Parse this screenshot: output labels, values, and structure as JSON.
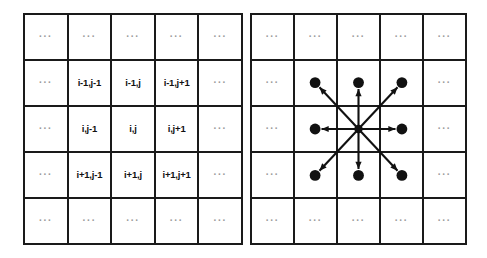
{
  "figure": {
    "title": "",
    "colors": {
      "grid_line": "#1a1a1a",
      "background": "#ffffff",
      "label_text": "#111111",
      "ellipsis_text": "#9a9a9a",
      "node_fill": "#111111",
      "arrow_stroke": "#111111"
    }
  },
  "ellipsis": "···",
  "left_grid": {
    "name": "index-grid",
    "rows": 5,
    "cols": 5,
    "cells": [
      [
        "···",
        "···",
        "···",
        "···",
        "···"
      ],
      [
        "···",
        "i-1,j-1",
        "i-1,j",
        "i-1,j+1",
        "···"
      ],
      [
        "···",
        "i,j-1",
        "i,j",
        "i,j+1",
        "···"
      ],
      [
        "···",
        "i+1,j-1",
        "i+1,j",
        "i+1,j+1",
        "···"
      ],
      [
        "···",
        "···",
        "···",
        "···",
        "···"
      ]
    ]
  },
  "right_grid": {
    "name": "neighborhood-grid",
    "rows": 5,
    "cols": 5,
    "cells": [
      [
        "···",
        "···",
        "···",
        "···",
        "···"
      ],
      [
        "···",
        "",
        "",
        "",
        "···"
      ],
      [
        "···",
        "",
        "",
        "",
        "···"
      ],
      [
        "···",
        "",
        "",
        "",
        "···"
      ],
      [
        "···",
        "···",
        "···",
        "···",
        "···"
      ]
    ],
    "center_node": {
      "col": 2,
      "row": 2
    },
    "neighbor_nodes": [
      {
        "col": 1,
        "row": 1,
        "direction": "up-left"
      },
      {
        "col": 2,
        "row": 1,
        "direction": "up"
      },
      {
        "col": 3,
        "row": 1,
        "direction": "up-right"
      },
      {
        "col": 1,
        "row": 2,
        "direction": "left"
      },
      {
        "col": 3,
        "row": 2,
        "direction": "right"
      },
      {
        "col": 1,
        "row": 3,
        "direction": "down-left"
      },
      {
        "col": 2,
        "row": 3,
        "direction": "down"
      },
      {
        "col": 3,
        "row": 3,
        "direction": "down-right"
      }
    ],
    "arrow_count": 8
  }
}
